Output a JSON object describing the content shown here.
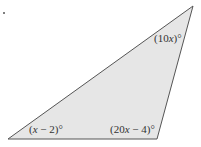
{
  "diagram": {
    "type": "triangle",
    "fill_color": "#e6e6e6",
    "stroke_color": "#555555",
    "vertices": {
      "top_right": [
        193,
        6
      ],
      "bottom_left": [
        8,
        139
      ],
      "bottom_right": [
        157,
        139
      ]
    },
    "angles": {
      "top_right": {
        "prefix": "(10",
        "variable": "x",
        "suffix": ")°"
      },
      "bottom_left": {
        "prefix": "(",
        "variable": "x",
        "suffix": " − 2)°"
      },
      "bottom_right": {
        "prefix": "(20",
        "variable": "x",
        "suffix": " − 4)°"
      }
    }
  }
}
